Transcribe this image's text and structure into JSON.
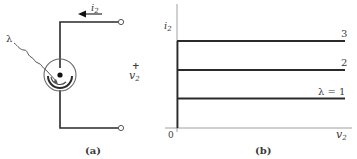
{
  "figure_a": {
    "caption": "(a)",
    "current_label": "i",
    "current_sub": "2",
    "light_label": "λ",
    "voltage_plus": "+",
    "voltage_label": "v",
    "voltage_sub": "2",
    "component": "photodiode-current-source"
  },
  "figure_b": {
    "caption": "(b)",
    "y_axis_label": "i",
    "y_axis_sub": "2",
    "x_axis_label": "v",
    "x_axis_sub": "2",
    "origin_label": "0",
    "curves": [
      {
        "label": "3",
        "level": 3
      },
      {
        "label": "2",
        "level": 2
      },
      {
        "label": "λ = 1",
        "level": 1
      }
    ]
  },
  "colors": {
    "line": "#2a2a2a",
    "text": "#3a3a3a",
    "circle": "#6a6a6a"
  }
}
